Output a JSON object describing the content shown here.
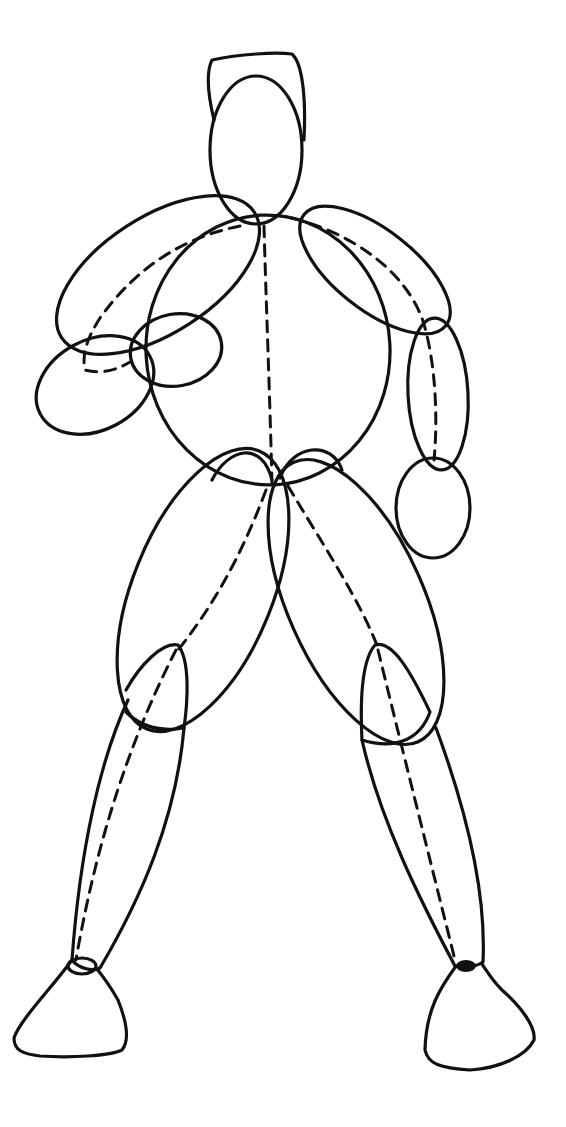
{
  "figure": {
    "description": "Line drawing of a standing human figure constructed from ovals with dashed center/axis lines",
    "stroke_color": "#111111",
    "background_color": "#ffffff",
    "parts": [
      "head",
      "hat",
      "torso",
      "left-upper-arm",
      "left-forearm",
      "left-hand",
      "right-upper-arm",
      "right-forearm",
      "right-hand",
      "pelvis-left",
      "pelvis-right",
      "left-thigh",
      "right-thigh",
      "left-knee",
      "right-knee",
      "left-shin",
      "right-shin",
      "left-foot",
      "right-foot"
    ]
  }
}
